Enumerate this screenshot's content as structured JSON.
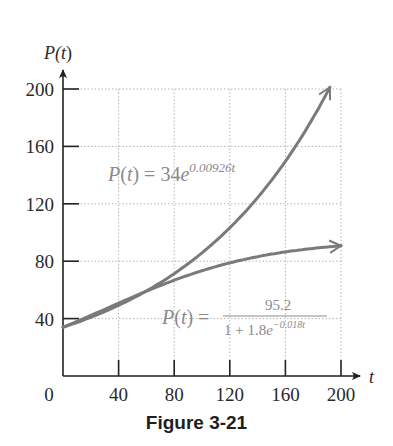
{
  "chart_data": {
    "type": "line",
    "title": "",
    "caption": "Figure 3-21",
    "xlabel": "t",
    "ylabel": "P(t)",
    "xlim": [
      0,
      200
    ],
    "ylim": [
      0,
      200
    ],
    "x_ticks": [
      0,
      40,
      80,
      120,
      160,
      200
    ],
    "y_ticks": [
      40,
      80,
      120,
      160,
      200
    ],
    "x_tick_labels": [
      "0",
      "40",
      "80",
      "120",
      "160",
      "200"
    ],
    "y_tick_labels": [
      "40",
      "80",
      "120",
      "160",
      "200"
    ],
    "grid": true,
    "legend": "none (inline equation labels)",
    "series": [
      {
        "name": "Exponential model",
        "label": "P(t) = 34e^{0.00926t}",
        "formula": {
          "a": 34,
          "k": 0.00926
        },
        "x": [
          0,
          40,
          80,
          120,
          160,
          192
        ],
        "values": [
          34.0,
          49.2,
          71.3,
          103.3,
          149.6,
          201.2
        ],
        "end_arrow": true
      },
      {
        "name": "Logistic model",
        "label": "P(t) = 95.2 / (1 + 1.8e^{-0.018t})",
        "formula": {
          "c": 95.2,
          "a": 1.8,
          "b": 0.018
        },
        "x": [
          0,
          40,
          80,
          120,
          160,
          200
        ],
        "values": [
          34.0,
          50.7,
          66.7,
          78.8,
          86.5,
          90.7
        ],
        "end_arrow": true
      }
    ],
    "colors": {
      "curves": "#7a7a7a",
      "axes": "#222222",
      "grid": "#b5b5b5",
      "equation_text": "#8a8a8a"
    }
  },
  "labels": {
    "y_axis": {
      "main": "P(",
      "var": "t",
      "close": ")"
    },
    "x_axis": "t",
    "exp_eq": {
      "lhs": "P(t) = 34",
      "base": "e",
      "exponent": "0.00926t"
    },
    "log_eq": {
      "lhs": "P(t) =",
      "numerator": "95.2",
      "denominator": "1 + 1.8",
      "base": "e",
      "exponent": "−0.018t"
    },
    "caption": "Figure 3-21"
  }
}
